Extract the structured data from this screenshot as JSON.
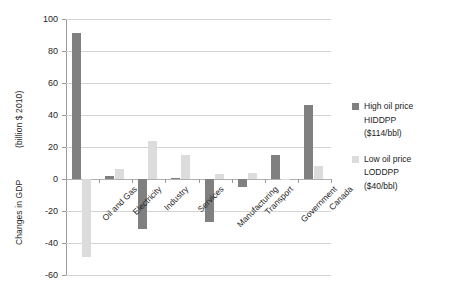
{
  "chart_data": {
    "type": "bar",
    "title": "",
    "xlabel": "",
    "ylabel": "Changes in GDP (billion $ 2010)",
    "ylim": [
      -60,
      100
    ],
    "ytick_step": 20,
    "grid": true,
    "legend_position": "right",
    "categories": [
      "Oil and Gas",
      "Electricity",
      "Industry",
      "Services",
      "Manufacturing",
      "Transport",
      "Government",
      "Canada"
    ],
    "yticks": [
      "100",
      "80",
      "60",
      "40",
      "20",
      "0",
      "-20",
      "-40",
      "-60"
    ],
    "series": [
      {
        "name": "High oil price HIDDPP ($114/bbl)",
        "color": "#808080",
        "values": [
          91,
          2,
          -31,
          0.5,
          -27,
          -5,
          15,
          46
        ]
      },
      {
        "name": "Low oil price LODDPP ($40/bbl)",
        "color": "#dcdcdc",
        "values": [
          -49,
          6,
          24,
          15,
          3,
          4,
          0,
          8
        ]
      }
    ]
  },
  "axis": {
    "title_main": "Changes in GDP",
    "title_units": "(billion $ 2010)"
  },
  "legend": {
    "entries": [
      {
        "swatch": "high-oil-price-swatch",
        "line1": "High oil price",
        "line2": "HIDDPP",
        "line3": "($114/bbl)"
      },
      {
        "swatch": "low-oil-price-swatch",
        "line1": "Low oil price",
        "line2": "LODDPP",
        "line3": "($40/bbl)"
      }
    ]
  }
}
